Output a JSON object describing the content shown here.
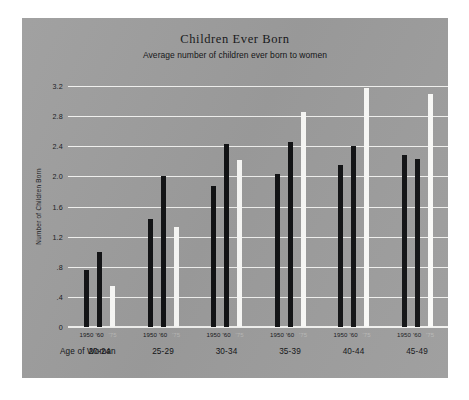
{
  "chart_data": {
    "type": "bar",
    "title": "Children Ever Born",
    "subtitle": "Average number of children ever born to women",
    "xlabel": "Age of Woman",
    "ylabel": "Number of Children Born",
    "ylim": [
      0,
      3.2
    ],
    "ytick_labels": [
      "3.2",
      "2.8",
      "2.4",
      "2.0",
      "1.6",
      "1.2",
      ".8",
      ".4",
      "0"
    ],
    "ytick_values": [
      3.2,
      2.8,
      2.4,
      2.0,
      1.6,
      1.2,
      0.8,
      0.4,
      0
    ],
    "grid": true,
    "legend_position": "none",
    "categories": [
      "20-24",
      "25-29",
      "30-34",
      "35-39",
      "40-44",
      "45-49"
    ],
    "year_ticks": [
      "1950",
      "'60",
      "'75"
    ],
    "series": [
      {
        "name": "1950",
        "color": "#111214",
        "values": [
          0.76,
          1.43,
          1.87,
          2.03,
          2.15,
          2.29
        ]
      },
      {
        "name": "'60",
        "color": "#111214",
        "values": [
          1.0,
          2.0,
          2.43,
          2.45,
          2.4,
          2.23
        ]
      },
      {
        "name": "'75",
        "color": "#fbfbf9",
        "values": [
          0.55,
          1.33,
          2.22,
          2.86,
          3.17,
          3.09
        ]
      }
    ]
  },
  "colors": {
    "paper": "#9d9d9d",
    "page": "#ffffff",
    "grid": "#f2f2f0",
    "bar_dark": "#111214",
    "bar_light": "#fbfbf9",
    "text": "#15161a"
  }
}
